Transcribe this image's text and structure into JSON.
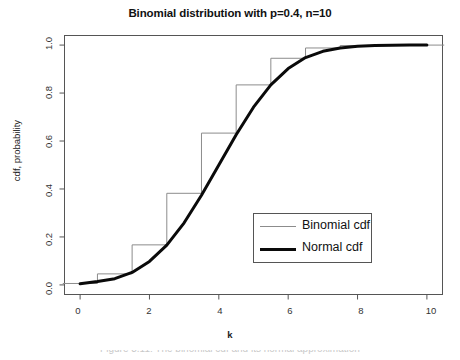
{
  "chart_data": {
    "type": "line",
    "title": "Binomial distribution with p=0.4, n=10",
    "xlabel": "k",
    "ylabel": "cdf, probability",
    "xlim": [
      -0.45,
      10.45
    ],
    "ylim": [
      -0.04,
      1.04
    ],
    "grid": false,
    "legend_position": "lower right",
    "xticks": [
      0,
      2,
      4,
      6,
      8,
      10
    ],
    "xtick_labels": [
      "0",
      "2",
      "4",
      "6",
      "8",
      "10"
    ],
    "yticks": [
      0.0,
      0.2,
      0.4,
      0.6,
      0.8,
      1.0
    ],
    "ytick_labels": [
      "0.0",
      "0.2",
      "0.4",
      "0.6",
      "0.8",
      "1.0"
    ],
    "parameters": {
      "p": 0.4,
      "n": 10,
      "mu": 4.0,
      "sigma": 1.549
    },
    "series": [
      {
        "name": "Binomial cdf",
        "style": "step",
        "color": "#8c8c8c",
        "linewidth": 1,
        "x": [
          0,
          1,
          2,
          3,
          4,
          5,
          6,
          7,
          8,
          9,
          10
        ],
        "values": [
          0.006,
          0.046,
          0.167,
          0.382,
          0.633,
          0.834,
          0.945,
          0.988,
          0.998,
          1.0,
          1.0
        ]
      },
      {
        "name": "Normal cdf",
        "style": "line",
        "color": "#0a0a0a",
        "linewidth": 3,
        "x": [
          0,
          0.5,
          1,
          1.5,
          2,
          2.5,
          3,
          3.5,
          4,
          4.5,
          5,
          5.5,
          6,
          6.5,
          7,
          7.5,
          8,
          8.5,
          9,
          9.5,
          10
        ],
        "values": [
          0.005,
          0.014,
          0.026,
          0.052,
          0.098,
          0.166,
          0.259,
          0.374,
          0.5,
          0.626,
          0.741,
          0.834,
          0.902,
          0.948,
          0.974,
          0.988,
          0.995,
          0.998,
          0.999,
          1.0,
          1.0
        ]
      }
    ]
  },
  "legend": {
    "entries": [
      {
        "label": "Binomial cdf"
      },
      {
        "label": "Normal cdf"
      }
    ]
  },
  "caption": {
    "text": "Figure 3.11: The binomial cdf and its normal approximation"
  }
}
